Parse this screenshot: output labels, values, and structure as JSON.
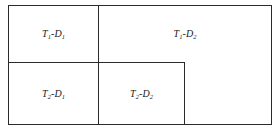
{
  "diagram": {
    "name": "treatment-dose-partition-diagram",
    "type": "partitioned-rectangle",
    "background_color": "#ffffff",
    "line_color": "#2b2b2b",
    "text_color": "#1a1a1a",
    "outer_frame": {
      "x": 8,
      "y": 5,
      "width": 264,
      "height": 120
    },
    "dividers": [
      {
        "name": "vertical-main",
        "orientation": "vertical",
        "x": 98,
        "y": 5,
        "length": 120
      },
      {
        "name": "horizontal-main",
        "orientation": "horizontal",
        "x": 8,
        "y": 62,
        "length": 177
      },
      {
        "name": "vertical-inner",
        "orientation": "vertical",
        "x": 184,
        "y": 62,
        "length": 63
      }
    ],
    "cells": [
      {
        "id": "t1d1",
        "label_main_1": "T",
        "label_sub_1": "1",
        "label_sep": "-",
        "label_main_2": "D",
        "label_sub_2": "1",
        "label_plain": "T1-D1",
        "region": {
          "x": 9,
          "y": 6,
          "width": 89,
          "height": 56
        }
      },
      {
        "id": "t1d2",
        "label_main_1": "T",
        "label_sub_1": "1",
        "label_sep": "-",
        "label_main_2": "D",
        "label_sub_2": "2",
        "label_plain": "T1-D2",
        "region": {
          "x": 99,
          "y": 6,
          "width": 172,
          "height": 56
        }
      },
      {
        "id": "t2d1",
        "label_main_1": "T",
        "label_sub_1": "2",
        "label_sep": "-",
        "label_main_2": "D",
        "label_sub_2": "1",
        "label_plain": "T2-D1",
        "region": {
          "x": 9,
          "y": 63,
          "width": 89,
          "height": 61
        }
      },
      {
        "id": "t2d2",
        "label_main_1": "T",
        "label_sub_1": "2",
        "label_sep": "-",
        "label_main_2": "D",
        "label_sub_2": "2",
        "label_plain": "T2-D2",
        "region": {
          "x": 99,
          "y": 63,
          "width": 85,
          "height": 61
        }
      },
      {
        "id": "empty",
        "label_main_1": "",
        "label_sub_1": "",
        "label_sep": "",
        "label_main_2": "",
        "label_sub_2": "",
        "label_plain": "",
        "region": {
          "x": 185,
          "y": 63,
          "width": 86,
          "height": 61
        }
      }
    ]
  }
}
